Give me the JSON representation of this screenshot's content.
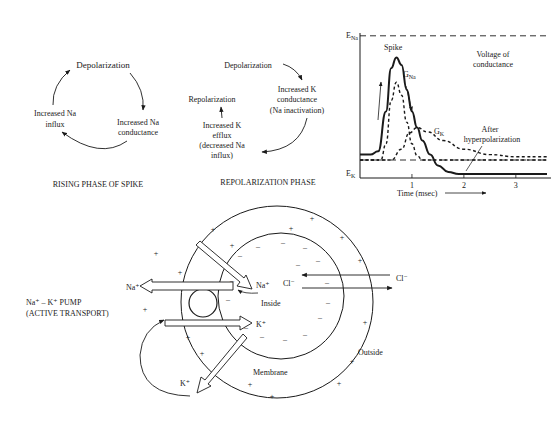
{
  "rising_phase": {
    "title": "RISING PHASE OF SPIKE",
    "nodes": [
      "Depolarization",
      "Increased Na",
      "conductance",
      "Increased Na",
      "influx"
    ]
  },
  "repolarization_phase": {
    "title": "REPOLARIZATION PHASE",
    "depolarization": "Depolarization",
    "k_conductance": [
      "Increased K",
      "conductance",
      "(Na inactivation)"
    ],
    "k_efflux": [
      "Increased K",
      "efflux",
      "(decreased Na",
      "influx)"
    ],
    "repolarization": "Repolarization"
  },
  "chart_data": {
    "type": "line",
    "title": "",
    "xlabel": "Time (msec)",
    "ylabel": "",
    "x_ticks": [
      "1",
      "2",
      "3"
    ],
    "y_labels": {
      "top": "E",
      "top_sub": "Na",
      "bottom": "E",
      "bottom_sub": "K"
    },
    "xlim": [
      0,
      3.6
    ],
    "annotations": {
      "spike": "Spike",
      "gna": "G",
      "gna_sub": "Na",
      "gk": "G",
      "gk_sub": "K",
      "voltage_of": "Voltage of",
      "conductance": "conductance",
      "after": "After",
      "hyperpolarization": "hyperpolarization"
    },
    "series": [
      {
        "name": "Spike (voltage)",
        "style": "solid",
        "x": [
          0,
          0.2,
          0.35,
          0.5,
          0.6,
          0.7,
          0.8,
          0.9,
          1.0,
          1.1,
          1.2,
          1.35,
          1.5,
          1.7,
          1.9,
          2.0,
          2.5,
          3.0,
          3.6
        ],
        "y": [
          0.05,
          0.05,
          0.08,
          0.45,
          0.85,
          0.95,
          0.88,
          0.65,
          0.45,
          0.3,
          0.18,
          0.05,
          -0.05,
          -0.11,
          -0.13,
          -0.13,
          -0.13,
          -0.13,
          -0.13
        ]
      },
      {
        "name": "G_Na",
        "style": "dashed",
        "x": [
          0,
          0.4,
          0.5,
          0.6,
          0.7,
          0.8,
          0.9,
          1.0,
          1.1,
          1.2,
          1.4,
          3.6
        ],
        "y": [
          0,
          0,
          0.15,
          0.55,
          0.72,
          0.6,
          0.35,
          0.15,
          0.04,
          0,
          0,
          0
        ]
      },
      {
        "name": "G_K",
        "style": "dashed",
        "x": [
          0,
          0.6,
          0.8,
          0.95,
          1.1,
          1.3,
          1.6,
          2.0,
          2.5,
          3.0,
          3.6
        ],
        "y": [
          0,
          0,
          0.1,
          0.25,
          0.3,
          0.26,
          0.18,
          0.1,
          0.05,
          0.03,
          0.03
        ]
      }
    ],
    "reference_lines": [
      {
        "name": "E_Na level",
        "style": "dashed",
        "y": 1.15
      },
      {
        "name": "resting level",
        "style": "dashed",
        "y": 0.0
      }
    ]
  },
  "cell_diagram": {
    "pump_label": [
      "Na⁺ – K⁺ PUMP",
      "(ACTIVE TRANSPORT)"
    ],
    "na_out": "Na⁺",
    "na_in": "Na⁺",
    "k_in": "K⁺",
    "k_out": "K⁺",
    "cl_in": "Cl⁻",
    "cl_out": "Cl⁻",
    "inside": "Inside",
    "outside": "Outside",
    "membrane": "Membrane",
    "plus": "+",
    "minus": "–"
  }
}
